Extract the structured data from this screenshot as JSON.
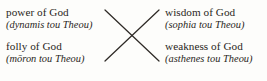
{
  "diagram": {
    "type": "chiasmus",
    "background_color": "#fdfdfb",
    "text_color": "#2a2622",
    "line_color": "#2e2a26",
    "labels": {
      "top_left": {
        "main": "power of God",
        "gloss": "(dynamis tou Theou)"
      },
      "bottom_left": {
        "main": "folly of God",
        "gloss": "(mōron tou Theou)"
      },
      "top_right": {
        "main": "wisdom of God",
        "gloss": "(sophia tou Theou)"
      },
      "bottom_right": {
        "main": "weakness of God",
        "gloss": "(asthenes tou Theou)"
      }
    },
    "connectors": [
      {
        "name": "power-to-weakness",
        "from": "top_left",
        "to": "bottom_right",
        "x1": 105,
        "y1": 10,
        "x2": 159,
        "y2": 61
      },
      {
        "name": "folly-to-wisdom",
        "from": "bottom_left",
        "to": "top_right",
        "x1": 105,
        "y1": 61,
        "x2": 159,
        "y2": 10
      }
    ],
    "intersection": {
      "x": 132,
      "y": 36
    }
  }
}
